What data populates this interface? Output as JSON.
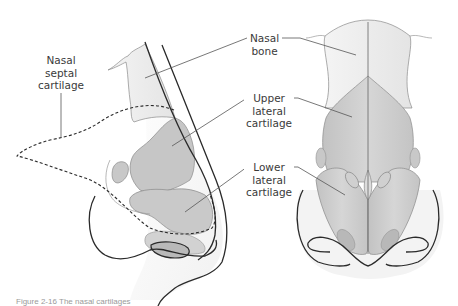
{
  "figure": {
    "views": [
      "lateral",
      "frontal"
    ],
    "labels": {
      "nasal_septal_cartilage": [
        "Nasal",
        "septal",
        "cartilage"
      ],
      "nasal_bone": [
        "Nasal",
        "bone"
      ],
      "upper_lateral_cartilage": [
        "Upper",
        "lateral",
        "cartilage"
      ],
      "lower_lateral_cartilage": [
        "Lower",
        "lateral",
        "cartilage"
      ]
    },
    "caption": "Figure 2-16  The nasal cartilages"
  },
  "colors": {
    "outline": "#2a2a2a",
    "bone_fill": "#ededed",
    "cartilage_fill": "#c9c9c9",
    "cartilage_light": "#d8d8d8",
    "leader_line": "#555555",
    "label_text": "#3a3a3a"
  }
}
